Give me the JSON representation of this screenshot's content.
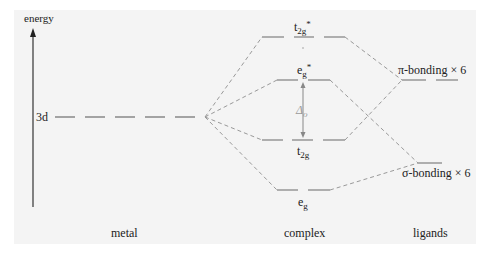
{
  "diagram": {
    "type": "molecular-orbital-energy-diagram",
    "axis": {
      "label": "energy"
    },
    "columns": {
      "metal": "metal",
      "complex": "complex",
      "ligands": "ligands"
    },
    "levels": {
      "metal_3d": {
        "label": "3d"
      },
      "t2g_star": {
        "base": "t",
        "sub": "2g",
        "sup": "*"
      },
      "eg_star": {
        "base": "e",
        "sub": "g",
        "sup": "*"
      },
      "t2g": {
        "base": "t",
        "sub": "2g"
      },
      "eg": {
        "base": "e",
        "sub": "g"
      },
      "pi_bonding": {
        "label": "π-bonding × 6"
      },
      "sigma_bonding": {
        "label": "σ-bonding × 6"
      }
    },
    "splitting": {
      "base": "Δ",
      "sub": "o"
    },
    "colors": {
      "background": "#f4f4f4",
      "line": "#888888",
      "text": "#222222"
    }
  }
}
